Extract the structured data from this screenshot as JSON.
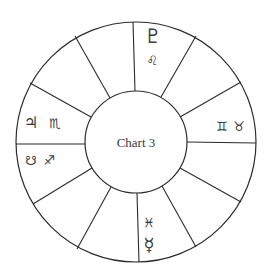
{
  "chart": {
    "title": "Chart 3",
    "center": [
      136,
      142
    ],
    "outer_radius": 120,
    "inner_radius": 51,
    "stroke_color": "#2b2b2b",
    "text_color": "#3a3a3a",
    "houses": 12
  },
  "house_labels": {
    "top": {
      "planet": "♇",
      "planet_name": "pluto-icon",
      "sign": "♌",
      "sign_name": "leo-icon"
    },
    "right": {
      "sign1": "♊",
      "sign1_name": "gemini-icon",
      "sign2": "♉",
      "sign2_name": "taurus-icon"
    },
    "left_upper": {
      "planet": "♃",
      "planet_name": "jupiter-icon",
      "sign": "♏",
      "sign_name": "scorpio-icon"
    },
    "left_lower": {
      "planet": "☋",
      "planet_name": "south-node-icon",
      "sign": "♐",
      "sign_name": "sagittarius-icon"
    },
    "bottom": {
      "sign": "♓",
      "sign_name": "pisces-icon",
      "planet": "☿",
      "planet_name": "mercury-icon"
    }
  }
}
